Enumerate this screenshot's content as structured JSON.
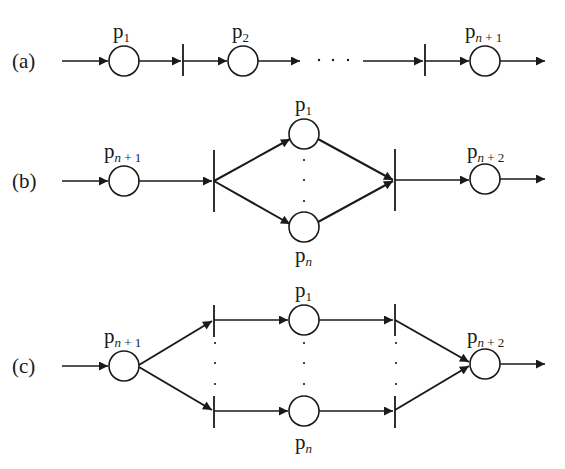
{
  "diagram": {
    "type": "petri-net-structures",
    "stroke_color": "#1a1a1a",
    "background": "#ffffff",
    "rows": [
      {
        "id": "a",
        "label": "(a)",
        "description": "sequential",
        "places": [
          {
            "base": "p",
            "sub": "1",
            "sub_italic": ""
          },
          {
            "base": "p",
            "sub": "2",
            "sub_italic": ""
          },
          {
            "base": "p",
            "sub": " + 1",
            "sub_italic": "n"
          }
        ],
        "ellipsis": "· · ·"
      },
      {
        "id": "b",
        "label": "(b)",
        "description": "parallel (fork/join)",
        "places": [
          {
            "base": "p",
            "sub": " + 1",
            "sub_italic": "n"
          },
          {
            "base": "p",
            "sub": "1",
            "sub_italic": ""
          },
          {
            "base": "p",
            "sub": "",
            "sub_italic": "n"
          },
          {
            "base": "p",
            "sub": " + 2",
            "sub_italic": "n"
          }
        ],
        "ellipsis": "·"
      },
      {
        "id": "c",
        "label": "(c)",
        "description": "choice (conflict/merge)",
        "places": [
          {
            "base": "p",
            "sub": " + 1",
            "sub_italic": "n"
          },
          {
            "base": "p",
            "sub": "1",
            "sub_italic": ""
          },
          {
            "base": "p",
            "sub": "",
            "sub_italic": "n"
          },
          {
            "base": "p",
            "sub": " + 2",
            "sub_italic": "n"
          }
        ],
        "ellipsis": "·"
      }
    ]
  }
}
